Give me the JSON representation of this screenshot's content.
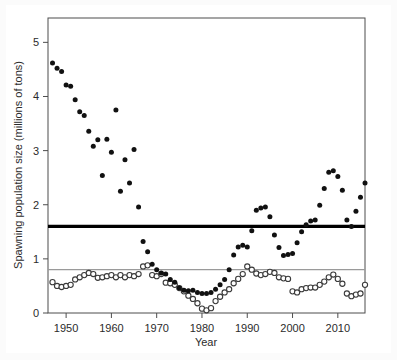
{
  "figure": {
    "background_color": "#fbfbfb",
    "panel_color": "#ffffff"
  },
  "chart_data": {
    "type": "scatter",
    "title": "",
    "xlabel": "Year",
    "ylabel": "Spawning population size (millions of tons)",
    "xlim": [
      1946,
      2016
    ],
    "ylim": [
      0,
      5.45
    ],
    "xticks": [
      1950,
      1960,
      1970,
      1980,
      1990,
      2000,
      2010
    ],
    "xtick_labels": [
      "1950",
      "1960",
      "1970",
      "1980",
      "1990",
      "2000",
      "2010"
    ],
    "yticks": [
      0,
      1,
      2,
      3,
      4,
      5
    ],
    "ytick_labels": [
      "0",
      "1",
      "2",
      "3",
      "4",
      "5"
    ],
    "grid": false,
    "legend": "none",
    "reference_lines": [
      {
        "name": "upper-reference-line",
        "value": 1.6,
        "color": "#000000",
        "width": 3.2,
        "style": "solid"
      },
      {
        "name": "lower-reference-line",
        "value": 0.8,
        "color": "#9a9a9a",
        "width": 1.3,
        "style": "solid"
      }
    ],
    "series": [
      {
        "name": "Spawning population size (filled circles)",
        "marker": "filled-circle",
        "color": "#111111",
        "points": [
          [
            1947,
            4.62
          ],
          [
            1948,
            4.52
          ],
          [
            1949,
            4.46
          ],
          [
            1950,
            4.21
          ],
          [
            1951,
            4.19
          ],
          [
            1952,
            3.94
          ],
          [
            1953,
            3.72
          ],
          [
            1954,
            3.65
          ],
          [
            1955,
            3.36
          ],
          [
            1956,
            3.08
          ],
          [
            1957,
            3.2
          ],
          [
            1958,
            2.54
          ],
          [
            1959,
            3.21
          ],
          [
            1960,
            2.97
          ],
          [
            1961,
            3.75
          ],
          [
            1962,
            2.25
          ],
          [
            1963,
            2.83
          ],
          [
            1964,
            2.4
          ],
          [
            1965,
            3.02
          ],
          [
            1966,
            1.96
          ],
          [
            1967,
            1.32
          ],
          [
            1968,
            1.13
          ],
          [
            1969,
            0.9
          ],
          [
            1970,
            0.8
          ],
          [
            1971,
            0.74
          ],
          [
            1972,
            0.72
          ],
          [
            1973,
            0.62
          ],
          [
            1974,
            0.57
          ],
          [
            1975,
            0.46
          ],
          [
            1976,
            0.42
          ],
          [
            1977,
            0.41
          ],
          [
            1978,
            0.42
          ],
          [
            1979,
            0.38
          ],
          [
            1980,
            0.36
          ],
          [
            1981,
            0.36
          ],
          [
            1982,
            0.38
          ],
          [
            1983,
            0.44
          ],
          [
            1984,
            0.52
          ],
          [
            1985,
            0.62
          ],
          [
            1986,
            0.8
          ],
          [
            1987,
            1.07
          ],
          [
            1988,
            1.22
          ],
          [
            1989,
            1.25
          ],
          [
            1990,
            1.22
          ],
          [
            1991,
            1.52
          ],
          [
            1992,
            1.9
          ],
          [
            1993,
            1.94
          ],
          [
            1994,
            1.96
          ],
          [
            1995,
            1.78
          ],
          [
            1996,
            1.44
          ],
          [
            1997,
            1.21
          ],
          [
            1998,
            1.06
          ],
          [
            1999,
            1.08
          ],
          [
            2000,
            1.1
          ],
          [
            2001,
            1.3
          ],
          [
            2002,
            1.5
          ],
          [
            2003,
            1.63
          ],
          [
            2004,
            1.7
          ],
          [
            2005,
            1.72
          ],
          [
            2006,
            1.99
          ],
          [
            2007,
            2.3
          ],
          [
            2008,
            2.6
          ],
          [
            2009,
            2.63
          ],
          [
            2010,
            2.52
          ],
          [
            2011,
            2.27
          ],
          [
            2012,
            1.72
          ],
          [
            2013,
            1.6
          ],
          [
            2014,
            1.88
          ],
          [
            2015,
            2.14
          ],
          [
            2016,
            2.4
          ],
          [
            2017,
            2.6
          ],
          [
            2018,
            2.33
          ],
          [
            2019,
            2.25
          ],
          [
            2020,
            2.18
          ]
        ]
      },
      {
        "name": "Spawning population size (open circles)",
        "marker": "open-circle",
        "color": "#ffffff",
        "edge_color": "#3a3a3a",
        "points": [
          [
            1947,
            0.57
          ],
          [
            1948,
            0.5
          ],
          [
            1949,
            0.48
          ],
          [
            1950,
            0.5
          ],
          [
            1951,
            0.52
          ],
          [
            1952,
            0.62
          ],
          [
            1953,
            0.66
          ],
          [
            1954,
            0.7
          ],
          [
            1955,
            0.74
          ],
          [
            1956,
            0.72
          ],
          [
            1957,
            0.65
          ],
          [
            1958,
            0.66
          ],
          [
            1959,
            0.68
          ],
          [
            1960,
            0.7
          ],
          [
            1961,
            0.66
          ],
          [
            1962,
            0.7
          ],
          [
            1963,
            0.66
          ],
          [
            1964,
            0.7
          ],
          [
            1965,
            0.68
          ],
          [
            1966,
            0.72
          ],
          [
            1967,
            0.86
          ],
          [
            1968,
            0.88
          ],
          [
            1969,
            0.7
          ],
          [
            1970,
            0.68
          ],
          [
            1971,
            0.72
          ],
          [
            1972,
            0.56
          ],
          [
            1973,
            0.55
          ],
          [
            1974,
            0.52
          ],
          [
            1975,
            0.46
          ],
          [
            1976,
            0.4
          ],
          [
            1977,
            0.32
          ],
          [
            1978,
            0.26
          ],
          [
            1979,
            0.18
          ],
          [
            1980,
            0.08
          ],
          [
            1981,
            0.05
          ],
          [
            1982,
            0.09
          ],
          [
            1983,
            0.22
          ],
          [
            1984,
            0.3
          ],
          [
            1985,
            0.38
          ],
          [
            1986,
            0.44
          ],
          [
            1987,
            0.55
          ],
          [
            1988,
            0.63
          ],
          [
            1989,
            0.72
          ],
          [
            1990,
            0.86
          ],
          [
            1991,
            0.8
          ],
          [
            1992,
            0.73
          ],
          [
            1993,
            0.7
          ],
          [
            1994,
            0.72
          ],
          [
            1995,
            0.76
          ],
          [
            1996,
            0.74
          ],
          [
            1997,
            0.66
          ],
          [
            1998,
            0.64
          ],
          [
            1999,
            0.63
          ],
          [
            2000,
            0.4
          ],
          [
            2001,
            0.38
          ],
          [
            2002,
            0.44
          ],
          [
            2003,
            0.46
          ],
          [
            2004,
            0.47
          ],
          [
            2005,
            0.47
          ],
          [
            2006,
            0.52
          ],
          [
            2007,
            0.58
          ],
          [
            2008,
            0.66
          ],
          [
            2009,
            0.71
          ],
          [
            2010,
            0.63
          ],
          [
            2011,
            0.54
          ],
          [
            2012,
            0.36
          ],
          [
            2013,
            0.31
          ],
          [
            2014,
            0.34
          ],
          [
            2015,
            0.36
          ],
          [
            2016,
            0.52
          ],
          [
            2017,
            0.56
          ],
          [
            2018,
            0.58
          ],
          [
            2019,
            0.54
          ],
          [
            2020,
            0.5
          ]
        ]
      }
    ]
  }
}
